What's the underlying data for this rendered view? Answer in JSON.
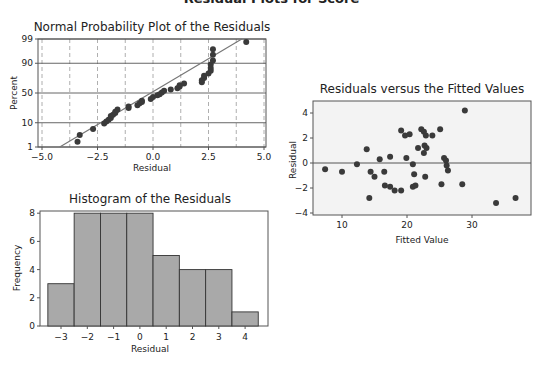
{
  "figure": {
    "title": "Residual Plots for Score",
    "colors": {
      "frame": "#555555",
      "point": "#3a3a3a",
      "fit_line": "#777777",
      "grid_solid": "#555555",
      "grid_dashed": "#9a9a9a",
      "bar_fill": "#a9a9a9",
      "bar_stroke": "#333333",
      "scatter_bg": "#f3f3f3"
    }
  },
  "chart_data": [
    {
      "id": "normal-probability-plot",
      "type": "scatter",
      "title": "Normal Probability Plot of the Residuals",
      "xlabel": "Residual",
      "ylabel": "Percent",
      "xlim": [
        -5.0,
        5.0
      ],
      "x_ticks": [
        "-5.0",
        "-2.5",
        "0.0",
        "2.5",
        "5.0"
      ],
      "y_ticks": [
        "1",
        "10",
        "50",
        "90",
        "99"
      ],
      "y_scale": "normal probability",
      "grid": true,
      "fit_line": {
        "x_at_1pct": -4.2,
        "x_at_99pct": 4.0
      },
      "points": [
        {
          "x": -3.4,
          "y": 1.8
        },
        {
          "x": -3.3,
          "y": 3.5
        },
        {
          "x": -2.7,
          "y": 6.0
        },
        {
          "x": -2.2,
          "y": 9.5
        },
        {
          "x": -2.1,
          "y": 11
        },
        {
          "x": -2.0,
          "y": 12.5
        },
        {
          "x": -1.9,
          "y": 14
        },
        {
          "x": -1.9,
          "y": 16
        },
        {
          "x": -1.8,
          "y": 17.5
        },
        {
          "x": -1.7,
          "y": 19.5
        },
        {
          "x": -1.7,
          "y": 21
        },
        {
          "x": -1.6,
          "y": 24
        },
        {
          "x": -1.1,
          "y": 26
        },
        {
          "x": -1.1,
          "y": 28
        },
        {
          "x": -0.7,
          "y": 30
        },
        {
          "x": -0.6,
          "y": 33
        },
        {
          "x": -0.5,
          "y": 35
        },
        {
          "x": -0.5,
          "y": 37
        },
        {
          "x": -0.1,
          "y": 40
        },
        {
          "x": 0.0,
          "y": 43
        },
        {
          "x": 0.2,
          "y": 46
        },
        {
          "x": 0.3,
          "y": 48
        },
        {
          "x": 0.4,
          "y": 51
        },
        {
          "x": 0.5,
          "y": 54
        },
        {
          "x": 0.8,
          "y": 56
        },
        {
          "x": 1.1,
          "y": 58
        },
        {
          "x": 1.2,
          "y": 61
        },
        {
          "x": 1.2,
          "y": 63
        },
        {
          "x": 1.4,
          "y": 66
        },
        {
          "x": 2.2,
          "y": 68
        },
        {
          "x": 2.2,
          "y": 71
        },
        {
          "x": 2.3,
          "y": 74
        },
        {
          "x": 2.3,
          "y": 77
        },
        {
          "x": 2.5,
          "y": 80
        },
        {
          "x": 2.6,
          "y": 83
        },
        {
          "x": 2.6,
          "y": 86
        },
        {
          "x": 2.6,
          "y": 89
        },
        {
          "x": 2.7,
          "y": 92
        },
        {
          "x": 2.7,
          "y": 95
        },
        {
          "x": 2.7,
          "y": 97
        },
        {
          "x": 4.2,
          "y": 98.6
        }
      ]
    },
    {
      "id": "residuals-vs-fitted",
      "type": "scatter",
      "title": "Residuals versus the Fitted Values",
      "xlabel": "Fitted Value",
      "ylabel": "Residual",
      "xlim": [
        5,
        39
      ],
      "ylim": [
        -4,
        5
      ],
      "x_ticks": [
        "10",
        "20",
        "30"
      ],
      "y_ticks": [
        "-4",
        "-2",
        "0",
        "2",
        "4"
      ],
      "reference_line": 0,
      "grid": false,
      "points": [
        {
          "x": 7.4,
          "y": -0.5
        },
        {
          "x": 10.0,
          "y": -0.7
        },
        {
          "x": 12.3,
          "y": -0.1
        },
        {
          "x": 13.8,
          "y": 1.1
        },
        {
          "x": 14.2,
          "y": -2.8
        },
        {
          "x": 14.4,
          "y": -0.7
        },
        {
          "x": 15.0,
          "y": -1.1
        },
        {
          "x": 15.8,
          "y": 0.3
        },
        {
          "x": 16.5,
          "y": -0.7
        },
        {
          "x": 16.6,
          "y": -1.8
        },
        {
          "x": 17.4,
          "y": 0.5
        },
        {
          "x": 17.4,
          "y": -1.9
        },
        {
          "x": 18.1,
          "y": -2.2
        },
        {
          "x": 19.1,
          "y": 2.6
        },
        {
          "x": 19.1,
          "y": -2.2
        },
        {
          "x": 19.7,
          "y": 2.2
        },
        {
          "x": 19.9,
          "y": 0.4
        },
        {
          "x": 20.4,
          "y": 2.3
        },
        {
          "x": 20.9,
          "y": -1.9
        },
        {
          "x": 20.9,
          "y": -0.1
        },
        {
          "x": 21.1,
          "y": -0.9
        },
        {
          "x": 21.3,
          "y": -1.8
        },
        {
          "x": 21.7,
          "y": 1.2
        },
        {
          "x": 22.2,
          "y": 2.7
        },
        {
          "x": 22.6,
          "y": 2.5
        },
        {
          "x": 22.7,
          "y": 1.4
        },
        {
          "x": 22.6,
          "y": 0.8
        },
        {
          "x": 22.9,
          "y": 2.2
        },
        {
          "x": 23.0,
          "y": 1.2
        },
        {
          "x": 22.8,
          "y": -1.1
        },
        {
          "x": 23.9,
          "y": 2.2
        },
        {
          "x": 25.1,
          "y": 2.7
        },
        {
          "x": 25.3,
          "y": -1.7
        },
        {
          "x": 25.7,
          "y": 0.4
        },
        {
          "x": 26.0,
          "y": 0.2
        },
        {
          "x": 26.1,
          "y": -0.2
        },
        {
          "x": 26.3,
          "y": -0.6
        },
        {
          "x": 28.9,
          "y": 4.2
        },
        {
          "x": 28.5,
          "y": -1.7
        },
        {
          "x": 33.7,
          "y": -3.2
        },
        {
          "x": 36.7,
          "y": -2.8
        }
      ]
    },
    {
      "id": "histogram",
      "type": "bar",
      "title": "Histogram of the Residuals",
      "xlabel": "Residual",
      "ylabel": "Frequency",
      "categories": [
        "-3",
        "-2",
        "-1",
        "0",
        "1",
        "2",
        "3",
        "4"
      ],
      "values": [
        3,
        8,
        8,
        8,
        5,
        4,
        4,
        1
      ],
      "ylim": [
        0,
        8.5
      ],
      "y_ticks": [
        "0",
        "2",
        "4",
        "6",
        "8"
      ],
      "grid": false
    }
  ]
}
